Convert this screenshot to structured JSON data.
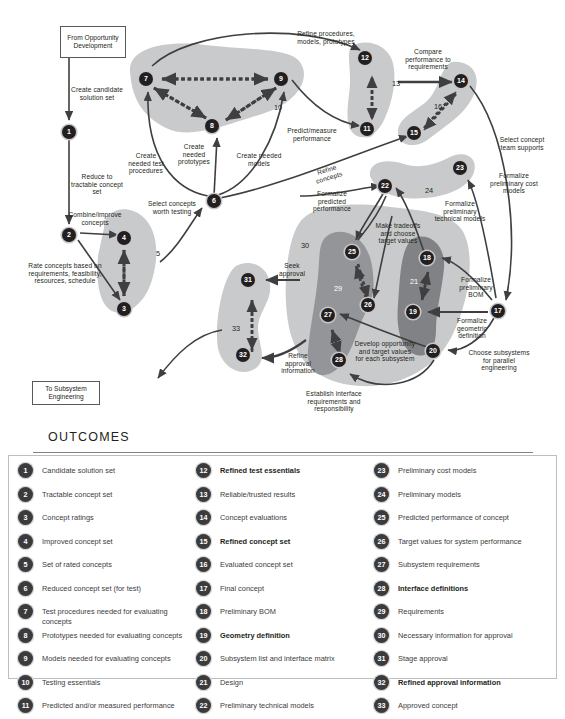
{
  "diagram": {
    "terminators": [
      {
        "id": "from-opportunity-development",
        "text": "From Opportunity Development",
        "x": 60,
        "y": 26,
        "w": 66,
        "h": 32
      },
      {
        "id": "to-subsystem-engineering",
        "text": "To Subsystem Engineering",
        "x": 32,
        "y": 381,
        "w": 68,
        "h": 24
      }
    ],
    "nodes": [
      {
        "n": "1",
        "x": 62,
        "y": 125
      },
      {
        "n": "2",
        "x": 62,
        "y": 228
      },
      {
        "n": "3",
        "x": 117,
        "y": 302
      },
      {
        "n": "4",
        "x": 117,
        "y": 231
      },
      {
        "n": "6",
        "x": 207,
        "y": 194
      },
      {
        "n": "7",
        "x": 146,
        "y": 72
      },
      {
        "n": "8",
        "x": 212,
        "y": 119
      },
      {
        "n": "9",
        "x": 281,
        "y": 72
      },
      {
        "n": "11",
        "x": 367,
        "y": 122
      },
      {
        "n": "12",
        "x": 365,
        "y": 54
      },
      {
        "n": "14",
        "x": 461,
        "y": 74
      },
      {
        "n": "15",
        "x": 414,
        "y": 128
      },
      {
        "n": "17",
        "x": 498,
        "y": 305
      },
      {
        "n": "18",
        "x": 427,
        "y": 253
      },
      {
        "n": "19",
        "x": 413,
        "y": 306
      },
      {
        "n": "20",
        "x": 433,
        "y": 345
      },
      {
        "n": "22",
        "x": 385,
        "y": 182
      },
      {
        "n": "23",
        "x": 460,
        "y": 164
      },
      {
        "n": "25",
        "x": 352,
        "y": 246
      },
      {
        "n": "26",
        "x": 368,
        "y": 305
      },
      {
        "n": "27",
        "x": 328,
        "y": 309
      },
      {
        "n": "28",
        "x": 339,
        "y": 360
      },
      {
        "n": "31",
        "x": 248,
        "y": 280
      },
      {
        "n": "32",
        "x": 243,
        "y": 355
      }
    ],
    "blob_numbers": [
      {
        "n": "5",
        "x": 156,
        "y": 249,
        "white": false
      },
      {
        "n": "10",
        "x": 274,
        "y": 103,
        "white": false
      },
      {
        "n": "13",
        "x": 392,
        "y": 79,
        "white": false
      },
      {
        "n": "16",
        "x": 434,
        "y": 102,
        "white": false
      },
      {
        "n": "21",
        "x": 410,
        "y": 277,
        "white": true
      },
      {
        "n": "24",
        "x": 425,
        "y": 186,
        "white": false
      },
      {
        "n": "29",
        "x": 334,
        "y": 284,
        "white": true
      },
      {
        "n": "30",
        "x": 301,
        "y": 241,
        "white": false
      },
      {
        "n": "33",
        "x": 232,
        "y": 324,
        "white": false
      }
    ],
    "labels": [
      {
        "id": "create-candidate-solution-set",
        "text": "Create candidate solution set",
        "x": 68,
        "y": 86,
        "w": 58,
        "align": "center"
      },
      {
        "id": "reduce-to-tractable-concept-set",
        "text": "Reduce to tractable concept set",
        "x": 68,
        "y": 173,
        "w": 58,
        "align": "center"
      },
      {
        "id": "combine-improve-concepts",
        "text": "Combine/improve concepts",
        "x": 64,
        "y": 211,
        "w": 62,
        "align": "center"
      },
      {
        "id": "rate-concepts",
        "text": "Rate concepts based on requirements, feasibility, resources, schedule",
        "x": 24,
        "y": 262,
        "w": 82,
        "align": "center"
      },
      {
        "id": "select-concepts-worth-testing",
        "text": "Select concepts worth testing",
        "x": 142,
        "y": 200,
        "w": 60,
        "align": "center"
      },
      {
        "id": "create-needed-test-procedures",
        "text": "Create needed test procedures",
        "x": 124,
        "y": 152,
        "w": 44,
        "align": "center"
      },
      {
        "id": "create-needed-prototypes",
        "text": "Create needed prototypes",
        "x": 175,
        "y": 143,
        "w": 38,
        "align": "center"
      },
      {
        "id": "create-needed-models",
        "text": "Create needed models",
        "x": 233,
        "y": 152,
        "w": 52,
        "align": "center"
      },
      {
        "id": "refine-procedures-models-prototypes",
        "text": "Refine procedures, models, prototypes",
        "x": 288,
        "y": 30,
        "w": 76,
        "align": "center"
      },
      {
        "id": "predict-measure-performance",
        "text": "Predict/measure performance",
        "x": 282,
        "y": 127,
        "w": 60,
        "align": "center"
      },
      {
        "id": "compare-performance-to-requirements",
        "text": "Compare performance to requirements",
        "x": 396,
        "y": 48,
        "w": 64,
        "align": "center"
      },
      {
        "id": "select-concept-team-supports",
        "text": "Select concept team supports",
        "x": 498,
        "y": 136,
        "w": 48,
        "align": "center"
      },
      {
        "id": "refine-concepts",
        "text": "Refine concepts",
        "x": 310,
        "y": 166,
        "w": 36,
        "align": "center"
      },
      {
        "id": "formalize-predicted-performance",
        "text": "Formalize predicted performance",
        "x": 308,
        "y": 190,
        "w": 48,
        "align": "center"
      },
      {
        "id": "formalize-preliminary-cost-models",
        "text": "Formalize preliminary cost models",
        "x": 487,
        "y": 172,
        "w": 54,
        "align": "center"
      },
      {
        "id": "formalize-preliminary-technical-models",
        "text": "Formalize preliminary technical models",
        "x": 434,
        "y": 200,
        "w": 52,
        "align": "center"
      },
      {
        "id": "make-tradeoffs-and-choose-target-values",
        "text": "Make tradeoffs and choose target values",
        "x": 372,
        "y": 222,
        "w": 52,
        "align": "center"
      },
      {
        "id": "formalize-preliminary-bom",
        "text": "Formalize preliminary BOM",
        "x": 453,
        "y": 276,
        "w": 46,
        "align": "center"
      },
      {
        "id": "formalize-geometric-definition",
        "text": "Formalize geometric definition",
        "x": 448,
        "y": 317,
        "w": 48,
        "align": "center"
      },
      {
        "id": "choose-subsystems-for-parallel-engineering",
        "text": "Choose subsystems for parallel engineering",
        "x": 468,
        "y": 349,
        "w": 62,
        "align": "center"
      },
      {
        "id": "develop-opportunity-and-target-values",
        "text": "Develop opportunity and target values for each subsystem",
        "x": 354,
        "y": 340,
        "w": 62,
        "align": "center"
      },
      {
        "id": "establish-interface-requirements-and-responsibility",
        "text": "Establish interface requirements and responsibility",
        "x": 295,
        "y": 390,
        "w": 78,
        "align": "center"
      },
      {
        "id": "seek-approval",
        "text": "Seek approval",
        "x": 274,
        "y": 262,
        "w": 36,
        "align": "center"
      },
      {
        "id": "refine-approval-information",
        "text": "Refine approval information",
        "x": 277,
        "y": 352,
        "w": 42,
        "align": "center"
      }
    ]
  },
  "outcomes": {
    "title": "OUTCOMES",
    "columns": [
      [
        {
          "n": "1",
          "text": "Candidate solution set",
          "bold": false
        },
        {
          "n": "2",
          "text": "Tractable concept set",
          "bold": false
        },
        {
          "n": "3",
          "text": "Concept ratings",
          "bold": false
        },
        {
          "n": "4",
          "text": "Improved concept set",
          "bold": false
        },
        {
          "n": "5",
          "text": "Set of rated concepts",
          "bold": false
        },
        {
          "n": "6",
          "text": "Reduced concept set (for test)",
          "bold": false
        },
        {
          "n": "7",
          "text": "Test procedures needed for evaluating concepts",
          "bold": false
        },
        {
          "n": "8",
          "text": "Prototypes needed for evaluating concepts",
          "bold": false
        },
        {
          "n": "9",
          "text": "Models needed for evaluating concepts",
          "bold": false
        },
        {
          "n": "10",
          "text": "Testing essentials",
          "bold": false
        },
        {
          "n": "11",
          "text": "Predicted and/or measured performance",
          "bold": false
        }
      ],
      [
        {
          "n": "12",
          "text": "Refined test essentials",
          "bold": true
        },
        {
          "n": "13",
          "text": "Reliable/trusted results",
          "bold": false
        },
        {
          "n": "14",
          "text": "Concept evaluations",
          "bold": false
        },
        {
          "n": "15",
          "text": "Refined concept set",
          "bold": true
        },
        {
          "n": "16",
          "text": "Evaluated concept set",
          "bold": false
        },
        {
          "n": "17",
          "text": "Final concept",
          "bold": false
        },
        {
          "n": "18",
          "text": "Preliminary BOM",
          "bold": false
        },
        {
          "n": "19",
          "text": "Geometry definition",
          "bold": true
        },
        {
          "n": "20",
          "text": "Subsystem list and interface matrix",
          "bold": false
        },
        {
          "n": "21",
          "text": "Design",
          "bold": false
        },
        {
          "n": "22",
          "text": "Preliminary technical models",
          "bold": false
        }
      ],
      [
        {
          "n": "23",
          "text": "Preliminary cost models",
          "bold": false
        },
        {
          "n": "24",
          "text": "Preliminary models",
          "bold": false
        },
        {
          "n": "25",
          "text": "Predicted performance of concept",
          "bold": false
        },
        {
          "n": "26",
          "text": "Target values for system performance",
          "bold": false
        },
        {
          "n": "27",
          "text": "Subsystem requirements",
          "bold": false
        },
        {
          "n": "28",
          "text": "Interface definitions",
          "bold": true
        },
        {
          "n": "29",
          "text": "Requirements",
          "bold": false
        },
        {
          "n": "30",
          "text": "Necessary information for approval",
          "bold": false
        },
        {
          "n": "31",
          "text": "Stage approval",
          "bold": false
        },
        {
          "n": "32",
          "text": "Refined approval information",
          "bold": true
        },
        {
          "n": "33",
          "text": "Approved concept",
          "bold": false
        }
      ]
    ]
  }
}
